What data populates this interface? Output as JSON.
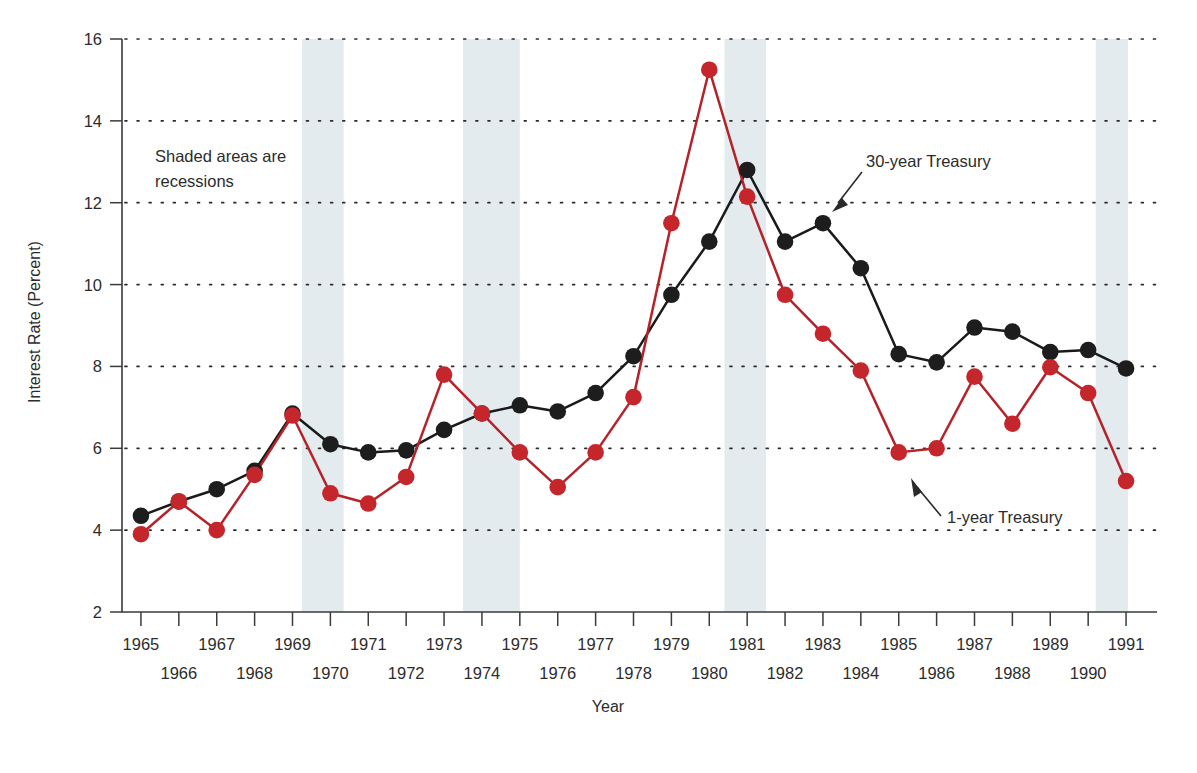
{
  "chart_data": {
    "type": "line",
    "title": "",
    "xlabel": "Year",
    "ylabel": "Interest Rate (Percent)",
    "xlim": [
      1964.5,
      1991.5
    ],
    "ylim": [
      2,
      16
    ],
    "yticks": [
      2,
      4,
      6,
      8,
      10,
      12,
      14,
      16
    ],
    "grid": "horizontal-dotted",
    "legend_position": "inline-annotations",
    "x": [
      1965,
      1966,
      1967,
      1968,
      1969,
      1970,
      1971,
      1972,
      1973,
      1974,
      1975,
      1976,
      1977,
      1978,
      1979,
      1980,
      1981,
      1982,
      1983,
      1984,
      1985,
      1986,
      1987,
      1988,
      1989,
      1990,
      1991
    ],
    "xtick_labels_row1": [
      "1965",
      "1967",
      "1969",
      "1971",
      "1973",
      "1975",
      "1977",
      "1979",
      "1981",
      "1983",
      "1985",
      "1987",
      "1989",
      "1991"
    ],
    "xtick_labels_row2": [
      "1966",
      "1968",
      "1970",
      "1972",
      "1974",
      "1976",
      "1978",
      "1980",
      "1982",
      "1984",
      "1986",
      "1988",
      "1990"
    ],
    "series": [
      {
        "name": "30-year Treasury",
        "color": "#1d1d1d",
        "values": [
          4.35,
          4.7,
          5.0,
          5.45,
          6.85,
          6.1,
          5.9,
          5.95,
          6.45,
          6.85,
          7.05,
          6.9,
          7.35,
          8.25,
          9.75,
          11.05,
          12.8,
          11.05,
          11.5,
          10.4,
          8.3,
          8.1,
          8.95,
          8.85,
          8.35,
          8.4,
          7.95
        ]
      },
      {
        "name": "1-year Treasury",
        "color": "#c4262c",
        "values": [
          3.9,
          4.7,
          4.0,
          5.35,
          6.8,
          4.9,
          4.65,
          5.3,
          7.8,
          6.85,
          5.9,
          5.05,
          5.9,
          7.25,
          11.5,
          15.25,
          12.15,
          9.75,
          8.8,
          7.9,
          5.9,
          6.0,
          7.75,
          6.6,
          7.98,
          7.35,
          5.2
        ]
      }
    ],
    "recessions": [
      {
        "start": 1969.25,
        "end": 1970.35
      },
      {
        "start": 1973.5,
        "end": 1975.0
      },
      {
        "start": 1980.4,
        "end": 1981.5
      },
      {
        "start": 1990.2,
        "end": 1991.05
      }
    ],
    "annotations": [
      {
        "id": "note-recessions",
        "text_line1": "Shaded areas are",
        "text_line2": "recessions"
      },
      {
        "id": "anno-30year",
        "text": "30-year Treasury"
      },
      {
        "id": "anno-1year",
        "text": "1-year Treasury"
      }
    ],
    "colors": {
      "series_black": "#1d1d1d",
      "series_red": "#c4262c",
      "recession_band": "#e3ebee",
      "axis": "#3b3b3b",
      "background": "#ffffff"
    }
  }
}
